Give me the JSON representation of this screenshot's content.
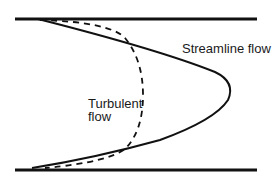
{
  "diagram": {
    "colors": {
      "stroke": "#111111",
      "background": "#ffffff"
    },
    "walls": {
      "top": {
        "x1": 15,
        "x2": 257,
        "y": 19
      },
      "bottom": {
        "x1": 15,
        "x2": 257,
        "y": 170
      }
    },
    "labels": {
      "streamline": "Streamline flow",
      "turbulent_line1": "Turbulent",
      "turbulent_line2": "flow"
    },
    "curves": [
      {
        "name": "streamline-profile",
        "style": "solid",
        "shape": "parabola",
        "apex": [
          228,
          94
        ]
      },
      {
        "name": "turbulent-profile",
        "style": "dashed",
        "shape": "blunt",
        "apex": [
          143,
          95
        ]
      }
    ]
  }
}
